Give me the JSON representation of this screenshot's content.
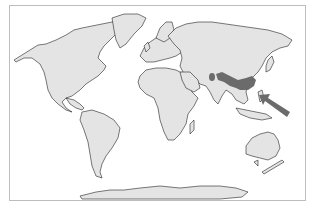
{
  "map": {
    "type": "world-map",
    "projection": "Mercator",
    "colors": {
      "background": "#ffffff",
      "land": "#e4e4e4",
      "coastline": "#222222",
      "highlight": "#6b6b6b",
      "arrow": "#6b6b6b",
      "frame": "#bdbdbd"
    },
    "highlighted_region": {
      "label": "",
      "area": "Central/Southern China with isolated patch on Tibetan plateau"
    },
    "arrow": {
      "direction": "pointing north-west",
      "target": "East China coast / Taiwan region"
    }
  }
}
